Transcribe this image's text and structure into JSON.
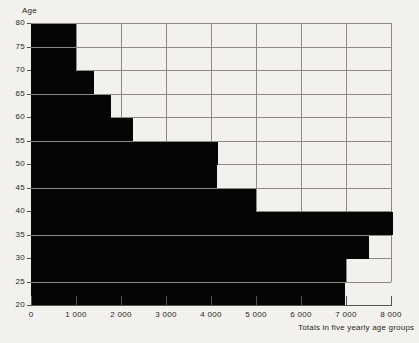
{
  "chart_data": {
    "type": "bar",
    "orientation": "horizontal",
    "title": "",
    "xlabel": "Totals in five yearly age groups",
    "ylabel": "Age",
    "categories": [
      "80",
      "75",
      "70",
      "65",
      "60",
      "55",
      "50",
      "45",
      "40",
      "35",
      "30",
      "25"
    ],
    "values": [
      1000,
      1000,
      1400,
      1780,
      2270,
      4150,
      4130,
      5000,
      8050,
      7500,
      7000,
      6980
    ],
    "xlim": [
      0,
      8000
    ],
    "ylim": [
      20,
      80
    ],
    "x_tick_labels": [
      "0",
      "1 000",
      "2 000",
      "3 000",
      "4 000",
      "5 000",
      "6 000",
      "7 000",
      "8 000"
    ],
    "x_tick_values": [
      0,
      1000,
      2000,
      3000,
      4000,
      5000,
      6000,
      7000,
      8000
    ],
    "y_tick_labels": [
      "80",
      "75",
      "70",
      "65",
      "60",
      "55",
      "50",
      "45",
      "40",
      "35",
      "30",
      "25",
      "20"
    ],
    "y_tick_values": [
      80,
      75,
      70,
      65,
      60,
      55,
      50,
      45,
      40,
      35,
      30,
      25,
      20
    ],
    "grid": true,
    "legend": null,
    "bar_color": "#050505",
    "grid_color": "#8d8a84",
    "axis_color": "#55534e",
    "background_color": "#f3f1ed"
  },
  "axis_titles": {
    "y": "Age",
    "x_caption": "Totals in five yearly age groups"
  }
}
